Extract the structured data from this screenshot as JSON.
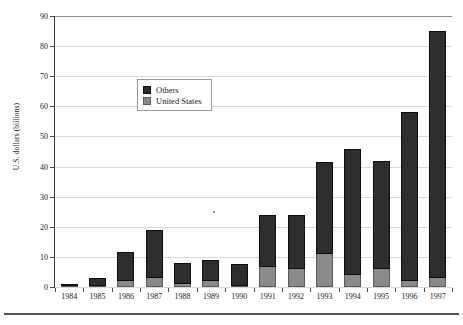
{
  "chart_data": {
    "type": "bar",
    "stacked": true,
    "title": "",
    "subtitle": "",
    "xlabel": "",
    "ylabel": "U.S. dollars (billions)",
    "categories": [
      "1984",
      "1985",
      "1986",
      "1987",
      "1988",
      "1989",
      "1990",
      "1991",
      "1992",
      "1993",
      "1994",
      "1995",
      "1996",
      "1997"
    ],
    "series": [
      {
        "name": "United States",
        "color": "#8a8a8a",
        "values": [
          0.3,
          0.5,
          2.0,
          3.0,
          1.0,
          2.0,
          0.3,
          6.5,
          6.0,
          11.0,
          4.0,
          6.0,
          2.0,
          3.0
        ]
      },
      {
        "name": "Others",
        "color": "#2e2e2e",
        "values": [
          0.7,
          2.5,
          9.5,
          16.0,
          7.0,
          7.0,
          7.2,
          17.5,
          18.0,
          30.5,
          42.0,
          36.0,
          56.0,
          82.0
        ]
      }
    ],
    "totals": [
      1.0,
      3.0,
      11.5,
      19.0,
      8.0,
      9.0,
      7.5,
      24.0,
      24.0,
      41.5,
      46.0,
      42.0,
      58.0,
      85.0
    ],
    "ylim": [
      0,
      90
    ],
    "yticks": [
      0,
      10,
      20,
      30,
      40,
      50,
      60,
      70,
      80,
      90
    ],
    "ytick_labels": [
      "0",
      "10",
      "20",
      "30",
      "40",
      "50",
      "60",
      "70",
      "80",
      "90"
    ],
    "grid": true,
    "grid_axis": "y",
    "legend_position": "inside-upper-center",
    "legend_entries": [
      "Others",
      "United States"
    ]
  },
  "axes": {
    "y_title": "U.S. dollars (billions)"
  },
  "legend": {
    "items": [
      {
        "label": "Others",
        "swatch": "others-swatch"
      },
      {
        "label": "United States",
        "swatch": "united-states-swatch"
      }
    ]
  }
}
